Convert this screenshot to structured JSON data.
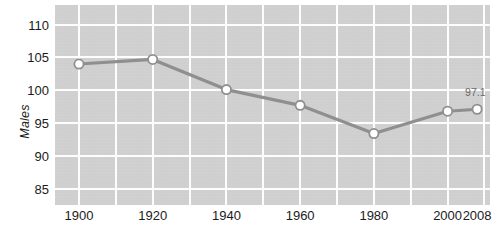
{
  "chart_data": {
    "type": "line",
    "title": "",
    "subtitle": "",
    "xlabel": "",
    "ylabel": "Males",
    "x": [
      1900,
      1920,
      1940,
      1960,
      1980,
      2000,
      2008
    ],
    "xticklabels": [
      "1900",
      "1920",
      "1940",
      "1960",
      "1980",
      "2000",
      "2008"
    ],
    "yticklabels": [
      "110",
      "105",
      "100",
      "95",
      "90",
      "85"
    ],
    "yticks": [
      110,
      105,
      100,
      95,
      90,
      85
    ],
    "ylim": [
      82.5,
      113.0
    ],
    "xlim": [
      1893.5,
      2011.5
    ],
    "values": [
      104.0,
      104.7,
      100.1,
      97.7,
      93.4,
      96.8,
      97.1
    ],
    "series": [
      {
        "name": "Males",
        "values": [
          104.0,
          104.7,
          100.1,
          97.7,
          93.4,
          96.8,
          97.1
        ]
      }
    ],
    "annotations": [
      {
        "label": "97.1",
        "x": 2008,
        "y": 97.1
      }
    ],
    "grid": true,
    "legend": false,
    "legend_position": "none",
    "colors": {
      "plot_background": "#d4d4d4",
      "gridline": "#fdfdfd",
      "line": "#8f8f8f",
      "marker_fill": "#ffffff",
      "marker_edge": "#8f8f8f",
      "tick_text": "#1b1b1b",
      "annotation_text": "#6a6a6a"
    }
  },
  "axis": {
    "y_title": "Males"
  }
}
